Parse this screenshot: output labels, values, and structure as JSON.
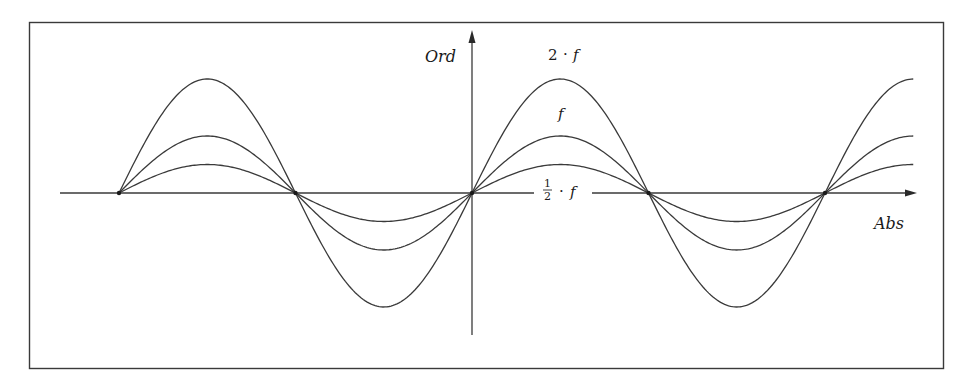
{
  "chart_data": {
    "type": "line",
    "title": "",
    "xlabel": "Abs",
    "ylabel": "Ord",
    "grid": false,
    "legend": "inline labels",
    "x_range_periods": [
      -2,
      2.5
    ],
    "series": [
      {
        "name": "2 · f",
        "amplitude": 2.0,
        "label_position": "above peak"
      },
      {
        "name": "f",
        "amplitude": 1.0,
        "label_position": "above peak"
      },
      {
        "name": "1/2 · f",
        "amplitude": 0.5,
        "label_position": "on x-axis"
      }
    ],
    "zero_crossings": [
      -2,
      -1,
      0,
      1,
      2
    ],
    "note": "Sine curves f(x)=a·sin(πx); each curve starts at x=-2 and ends near x=2.5 (peak)."
  },
  "labels": {
    "y_axis": "Ord",
    "x_axis": "Abs",
    "curve_2f_coef": "2",
    "curve_2f_dot": "·",
    "curve_2f_var": "f",
    "curve_f": "f",
    "curve_half_num": "1",
    "curve_half_den": "2",
    "curve_half_dot": "·",
    "curve_half_var": "f"
  },
  "colors": {
    "line": "#3a3a3a",
    "frame": "#3a3a3a",
    "background": "#ffffff"
  }
}
